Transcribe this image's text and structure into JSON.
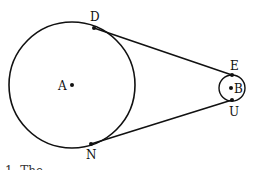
{
  "diagram": {
    "type": "geometry",
    "circles": [
      {
        "center": "A",
        "cx": 72,
        "cy": 85,
        "r": 63
      },
      {
        "center": "B",
        "cx": 232,
        "cy": 88,
        "r": 13
      }
    ],
    "tangents": [
      {
        "from": "D",
        "to": "E"
      },
      {
        "from": "N",
        "to": "U"
      }
    ],
    "points": {
      "A": {
        "label": "A",
        "x": 72,
        "y": 85
      },
      "B": {
        "label": "B",
        "x": 232,
        "y": 88
      },
      "D": {
        "label": "D",
        "x": 94,
        "y": 28
      },
      "E": {
        "label": "E",
        "x": 232,
        "y": 75
      },
      "N": {
        "label": "N",
        "x": 91,
        "y": 144
      },
      "U": {
        "label": "U",
        "x": 232,
        "y": 100
      }
    },
    "caption_fragment": "1. The"
  },
  "colors": {
    "stroke": "#111111",
    "background": "#ffffff"
  }
}
